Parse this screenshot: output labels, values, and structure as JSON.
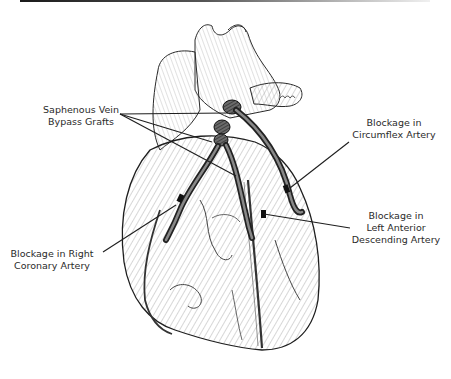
{
  "figure": {
    "labels": {
      "grafts": {
        "line1": "Saphenous Vein",
        "line2": "Bypass Grafts"
      },
      "circumflex": {
        "line1": "Blockage in",
        "line2": "Circumflex Artery"
      },
      "lad": {
        "line1": "Blockage in",
        "line2": "Left Anterior",
        "line3": "Descending Artery"
      },
      "rca": {
        "line1": "Blockage in Right",
        "line2": "Coronary Artery"
      }
    },
    "colors": {
      "ink": "#1e1e1e",
      "hatch": "#8a8a8a",
      "graft": "#3a3a3a",
      "background": "#ffffff"
    }
  }
}
